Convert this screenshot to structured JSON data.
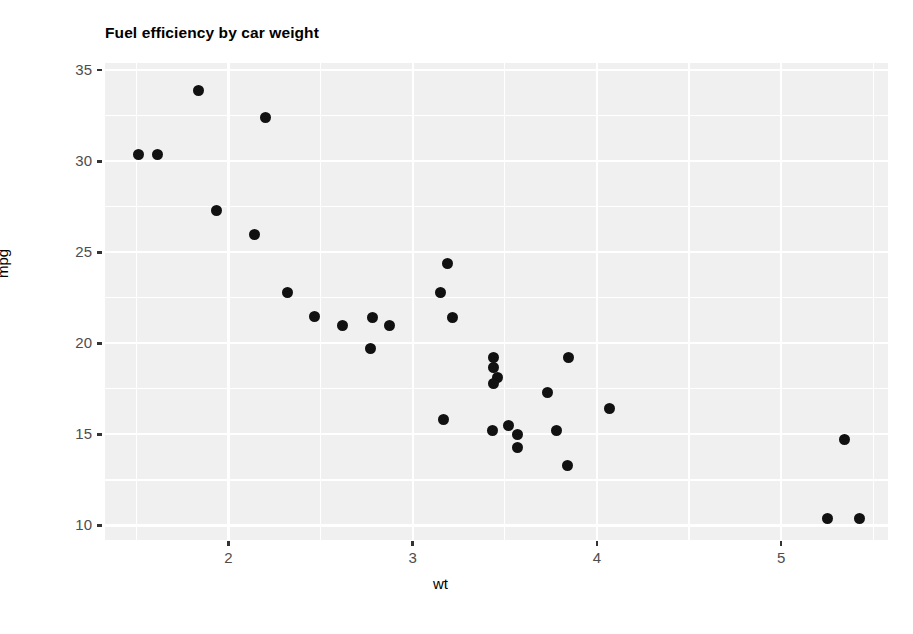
{
  "chart_data": {
    "type": "scatter",
    "title": "Fuel efficiency by car weight",
    "xlabel": "wt",
    "ylabel": "mpg",
    "xlim": [
      1.33,
      5.58
    ],
    "ylim": [
      9.2,
      35.4
    ],
    "xticks": [
      2,
      3,
      4,
      5
    ],
    "yticks": [
      10,
      15,
      20,
      25,
      30,
      35
    ],
    "xticklabels": [
      "2",
      "3",
      "4",
      "5"
    ],
    "yticklabels": [
      "10",
      "15",
      "20",
      "25",
      "30",
      "35"
    ],
    "x_minor_ticks": [
      1.5,
      2.5,
      3.5,
      4.5,
      5.5
    ],
    "y_minor_ticks": [
      12.5,
      17.5,
      22.5,
      27.5,
      32.5
    ],
    "grid": true,
    "legend": "none",
    "marker": {
      "shape": "circle",
      "color": "#111111",
      "size": 11
    },
    "panel_background": "#f0f0f0",
    "gridline_color": "#ffffff",
    "series": [
      {
        "name": "cars",
        "x": [
          2.62,
          2.875,
          2.32,
          3.215,
          3.44,
          3.46,
          3.57,
          3.19,
          3.15,
          3.44,
          3.44,
          4.07,
          3.73,
          3.78,
          5.25,
          5.424,
          5.345,
          2.2,
          1.615,
          1.835,
          2.465,
          3.52,
          3.435,
          3.84,
          3.845,
          1.935,
          2.14,
          1.513,
          3.17,
          2.77,
          3.57,
          2.78
        ],
        "y": [
          21.0,
          21.0,
          22.8,
          21.4,
          18.7,
          18.1,
          14.3,
          24.4,
          22.8,
          19.2,
          17.8,
          16.4,
          17.3,
          15.2,
          10.4,
          10.4,
          14.7,
          32.4,
          30.4,
          33.9,
          21.5,
          15.5,
          15.2,
          13.3,
          19.2,
          27.3,
          26.0,
          30.4,
          15.8,
          19.7,
          15.0,
          21.4
        ]
      }
    ]
  },
  "axis": {
    "y_title": "mpg",
    "x_title": "wt"
  }
}
